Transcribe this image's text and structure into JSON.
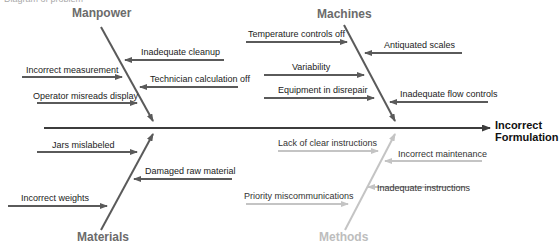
{
  "caption": "Diagram of problem",
  "effect": {
    "line1": "Incorrect",
    "line2": "Formulation"
  },
  "categories": {
    "manpower": {
      "label": "Manpower",
      "causes": [
        "Inadequate cleanup",
        "Incorrect measurement",
        "Technician calculation off",
        "Operator misreads display"
      ]
    },
    "machines": {
      "label": "Machines",
      "causes": [
        "Temperature controls off",
        "Antiquated scales",
        "Variability",
        "Equipment in disrepair",
        "Inadequate flow controls"
      ]
    },
    "materials": {
      "label": "Materials",
      "causes": [
        "Jars mislabeled",
        "Damaged raw material",
        "Incorrect weights"
      ]
    },
    "methods": {
      "label": "Methods",
      "causes": [
        "Lack of clear instructions",
        "Incorrect maintenance",
        "Priority miscommunications",
        "Inadequate instructions"
      ]
    }
  },
  "colors": {
    "dark_bone": "#5a5a5a",
    "light_bone": "#c4c4c4",
    "spine": "#3c3c3c",
    "dark_label": "#6b6b6b",
    "light_label": "#bdbdbd"
  }
}
